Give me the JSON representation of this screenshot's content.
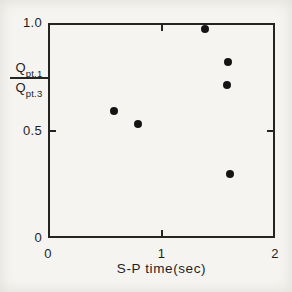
{
  "figure": {
    "background_color": "#f5f4f0",
    "ink_color": "#242424"
  },
  "chart_data": {
    "type": "scatter",
    "title": "",
    "xlabel": "S-P time(sec)",
    "ylabel": {
      "style": "fraction",
      "numerator_base": "Q",
      "numerator_sub": "pt.1",
      "denominator_base": "Q",
      "denominator_sub": "pt.3"
    },
    "xlim": [
      0,
      2
    ],
    "ylim": [
      0,
      1.0
    ],
    "x_ticks": [
      {
        "value": 0,
        "label": "0",
        "mark": false
      },
      {
        "value": 1,
        "label": "1",
        "mark": true
      },
      {
        "value": 2,
        "label": "2",
        "mark": false
      }
    ],
    "y_ticks": [
      {
        "value": 0,
        "label": "0",
        "mark": false
      },
      {
        "value": 0.5,
        "label": "0.5",
        "mark": true
      },
      {
        "value": 1.0,
        "label": "1.0",
        "mark": false
      }
    ],
    "points": [
      {
        "x": 0.58,
        "y": 0.59
      },
      {
        "x": 0.79,
        "y": 0.53
      },
      {
        "x": 1.38,
        "y": 0.97
      },
      {
        "x": 1.59,
        "y": 0.82
      },
      {
        "x": 1.58,
        "y": 0.71
      },
      {
        "x": 1.6,
        "y": 0.3
      }
    ],
    "marker": {
      "shape": "filled-circle",
      "color": "#141414",
      "diameter_px": 8
    },
    "grid": false,
    "frame": "box"
  }
}
